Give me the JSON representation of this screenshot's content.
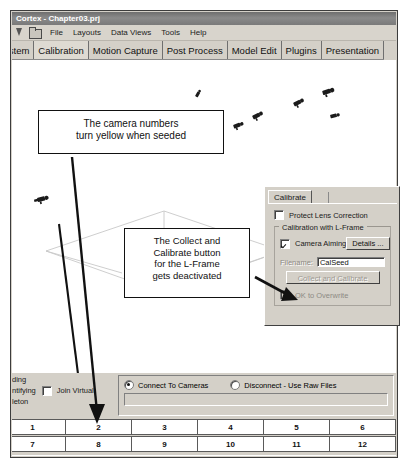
{
  "window": {
    "title": "Cortex - Chapter03.prj"
  },
  "menubar": {
    "icons": [
      "pointer-icon",
      "folder-icon"
    ],
    "items": [
      {
        "label": "File"
      },
      {
        "label": "Layouts"
      },
      {
        "label": "Data Views"
      },
      {
        "label": "Tools"
      },
      {
        "label": "Help"
      }
    ]
  },
  "tabstrip": {
    "tabs": [
      {
        "label": "ystem",
        "active": false
      },
      {
        "label": "Calibration",
        "active": true
      },
      {
        "label": "Motion Capture",
        "active": false
      },
      {
        "label": "Post Process",
        "active": false
      },
      {
        "label": "Model Edit",
        "active": false
      },
      {
        "label": "Plugins",
        "active": false
      },
      {
        "label": "Presentation",
        "active": false
      }
    ]
  },
  "callouts": {
    "cameras": {
      "lines": [
        "The camera numbers",
        "turn yellow when seeded"
      ]
    },
    "collect": {
      "lines": [
        "The Collect and",
        "Calibrate button",
        "for the L-Frame",
        "gets deactivated"
      ]
    }
  },
  "calibrate_dialog": {
    "tab_label": "Calibrate",
    "protect_lens": {
      "label": "Protect Lens Correction",
      "checked": false
    },
    "group_title": "Calibration with L-Frame",
    "camera_aiming": {
      "label": "Camera Aiming",
      "checked": true
    },
    "details_button": "Details ...",
    "filename_label": "Filename:",
    "filename_value": "CalSeed",
    "collect_button": "Collect and Calibrate",
    "collect_button_enabled": false,
    "overwrite": {
      "label": "OK to Overwrite",
      "checked": false,
      "enabled": false
    }
  },
  "bottom_bar": {
    "left_lines": [
      "ding",
      "ntifying",
      "leton"
    ],
    "join_virtual": {
      "label": "Join Virtual",
      "checked": false
    },
    "radio_connect": {
      "label": "Connect To Cameras",
      "selected": true
    },
    "radio_disconnect": {
      "label": "Disconnect - Use Raw Files",
      "selected": false
    },
    "text_field_value": ""
  },
  "camera_grid": {
    "row1": [
      "1",
      "2",
      "3",
      "4",
      "5",
      "6"
    ],
    "row2": [
      "7",
      "8",
      "9",
      "10",
      "11",
      "12"
    ]
  },
  "colors": {
    "chrome": "#d4d0c8",
    "viewport": "#ffffff",
    "ink": "#111111",
    "titlebar": "#7a7a7a"
  }
}
